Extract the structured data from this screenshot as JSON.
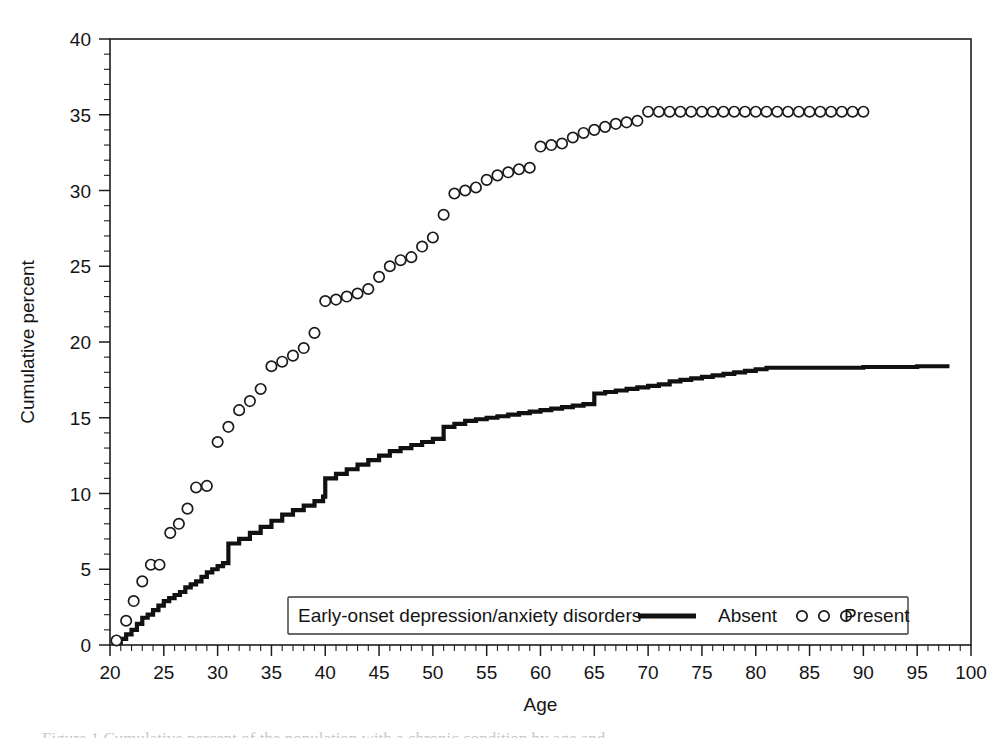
{
  "chart_data": {
    "type": "line",
    "title": "",
    "xlabel": "Age",
    "ylabel": "Cumulative percent",
    "xlim": [
      20,
      100
    ],
    "ylim": [
      0,
      40
    ],
    "xticks": [
      20,
      25,
      30,
      35,
      40,
      45,
      50,
      55,
      60,
      65,
      70,
      75,
      80,
      85,
      90,
      95,
      100
    ],
    "yticks": [
      0,
      5,
      10,
      15,
      20,
      25,
      30,
      35,
      40
    ],
    "xtick_minor_step": 1,
    "ytick_minor_step": 1,
    "grid": false,
    "legend_position": "bottom-center",
    "legend_title": "Early-onset depression/anxiety disorders",
    "series": [
      {
        "name": "Absent",
        "style": "step-line",
        "x": [
          20.5,
          21,
          21.5,
          22,
          22.5,
          23,
          23.5,
          24,
          24.5,
          25,
          25.5,
          26,
          26.5,
          27,
          27.5,
          28,
          28.5,
          29,
          29.5,
          30,
          30.5,
          31,
          32,
          33,
          34,
          35,
          36,
          37,
          38,
          39,
          39.8,
          40,
          41,
          42,
          43,
          44,
          45,
          46,
          47,
          48,
          49,
          50,
          51,
          52,
          53,
          54,
          55,
          56,
          57,
          58,
          59,
          60,
          61,
          62,
          63,
          64,
          65,
          66,
          67,
          68,
          69,
          70,
          71,
          72,
          73,
          74,
          75,
          76,
          77,
          78,
          79,
          80,
          81,
          82,
          85,
          90,
          95,
          98
        ],
        "y": [
          0.15,
          0.4,
          0.7,
          1.0,
          1.4,
          1.8,
          2.0,
          2.3,
          2.6,
          2.9,
          3.1,
          3.3,
          3.5,
          3.8,
          4.0,
          4.2,
          4.5,
          4.8,
          5.0,
          5.2,
          5.4,
          6.7,
          7.0,
          7.4,
          7.8,
          8.2,
          8.6,
          8.9,
          9.2,
          9.5,
          9.8,
          11.0,
          11.3,
          11.6,
          11.9,
          12.2,
          12.5,
          12.8,
          13.0,
          13.2,
          13.4,
          13.6,
          14.4,
          14.6,
          14.8,
          14.9,
          15.0,
          15.1,
          15.2,
          15.3,
          15.4,
          15.5,
          15.6,
          15.7,
          15.8,
          15.9,
          16.6,
          16.7,
          16.8,
          16.9,
          17.0,
          17.1,
          17.2,
          17.4,
          17.5,
          17.6,
          17.7,
          17.8,
          17.9,
          18.0,
          18.1,
          18.2,
          18.3,
          18.3,
          18.3,
          18.35,
          18.4,
          18.4
        ]
      },
      {
        "name": "Present",
        "style": "open-circles",
        "x": [
          20.6,
          21.5,
          22.2,
          23.0,
          23.8,
          24.6,
          25.6,
          26.4,
          27.2,
          28.0,
          29.0,
          30.0,
          31.0,
          32.0,
          33.0,
          34.0,
          35.0,
          36.0,
          37.0,
          38.0,
          39.0,
          40.0,
          41.0,
          42.0,
          43.0,
          44.0,
          45.0,
          46.0,
          47.0,
          48.0,
          49.0,
          50.0,
          51.0,
          52.0,
          53.0,
          54.0,
          55.0,
          56.0,
          57.0,
          58.0,
          59.0,
          60.0,
          61.0,
          62.0,
          63.0,
          64.0,
          65.0,
          66.0,
          67.0,
          68.0,
          69.0,
          70.0,
          71.0,
          72.0,
          73.0,
          74.0,
          75.0,
          76.0,
          77.0,
          78.0,
          79.0,
          80.0,
          81.0,
          82.0,
          83.0,
          84.0,
          85.0,
          86.0,
          87.0,
          88.0,
          89.0,
          90.0
        ],
        "y": [
          0.3,
          1.6,
          2.9,
          4.2,
          5.3,
          5.3,
          7.4,
          8.0,
          9.0,
          10.4,
          10.5,
          13.4,
          14.4,
          15.5,
          16.1,
          16.9,
          18.4,
          18.7,
          19.1,
          19.6,
          20.6,
          22.7,
          22.8,
          23.0,
          23.2,
          23.5,
          24.3,
          25.0,
          25.4,
          25.6,
          26.3,
          26.9,
          28.4,
          29.8,
          30.0,
          30.2,
          30.7,
          31.0,
          31.2,
          31.4,
          31.5,
          32.9,
          33.0,
          33.1,
          33.5,
          33.8,
          34.0,
          34.2,
          34.4,
          34.5,
          34.6,
          35.2,
          35.2,
          35.2,
          35.2,
          35.2,
          35.2,
          35.2,
          35.2,
          35.2,
          35.2,
          35.2,
          35.2,
          35.2,
          35.2,
          35.2,
          35.2,
          35.2,
          35.2,
          35.2,
          35.2,
          35.2
        ]
      }
    ]
  },
  "legend": {
    "title": "Early-onset depression/anxiety disorders",
    "entries": [
      {
        "label": "Absent",
        "marker": "solid-line"
      },
      {
        "label": "Present",
        "marker": "open-circles"
      }
    ]
  },
  "axes": {
    "x_title": "Age",
    "y_title": "Cumulative percent"
  },
  "caption": {
    "text": "Figure 1 Cumulative percent of the population with a chronic condition by age and"
  },
  "colors": {
    "line": "#111111",
    "marker_stroke": "#1a1a1a",
    "marker_fill": "#ffffff",
    "frame": "#1d1d1d",
    "text": "#141414",
    "background": "#ffffff"
  }
}
